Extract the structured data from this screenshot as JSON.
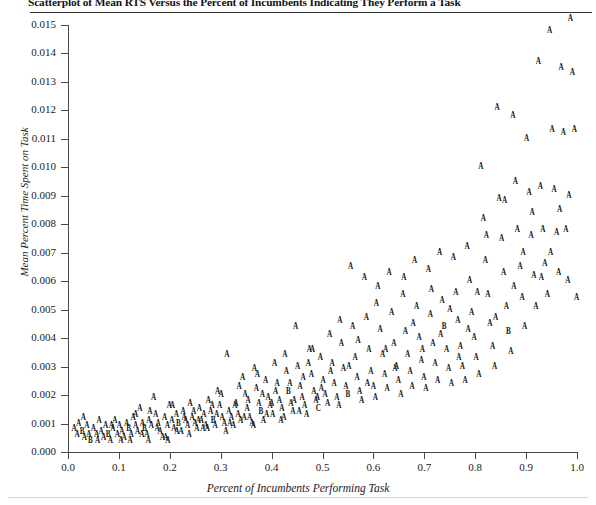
{
  "title": "Scatterplot of Mean RTS Versus the Percent of Incumbents Indicating They Perform a Task",
  "axes": {
    "xlabel": "Percent of Incumbents Performing Task",
    "ylabel": "Mean Percent Time Spent on Task",
    "xticks": [
      "0.0",
      "0.1",
      "0.2",
      "0.3",
      "0.4",
      "0.5",
      "0.6",
      "0.7",
      "0.8",
      "0.9",
      "1.0"
    ],
    "yticks": [
      "0.000",
      "0.001",
      "0.002",
      "0.003",
      "0.004",
      "0.005",
      "0.006",
      "0.007",
      "0.008",
      "0.009",
      "0.010",
      "0.011",
      "0.012",
      "0.013",
      "0.014",
      "0.015"
    ]
  },
  "chart_data": {
    "type": "scatter",
    "title": "Scatterplot of Mean RTS Versus the Percent of Incumbents Indicating They Perform a Task",
    "xlabel": "Percent of Incumbents Performing Task",
    "ylabel": "Mean Percent Time Spent on Task",
    "xlim": [
      0.0,
      1.0
    ],
    "ylim": [
      0.0,
      0.015
    ],
    "xticks": [
      0.0,
      0.1,
      0.2,
      0.3,
      0.4,
      0.5,
      0.6,
      0.7,
      0.8,
      0.9,
      1.0
    ],
    "yticks": [
      0.0,
      0.001,
      0.002,
      0.003,
      0.004,
      0.005,
      0.006,
      0.007,
      0.008,
      0.009,
      0.01,
      0.011,
      0.012,
      0.013,
      0.014,
      0.015
    ],
    "grid": false,
    "legend": null,
    "marker_glyphs": [
      "A",
      "B",
      "C"
    ],
    "marker_note": "Plot symbols are letter glyphs denoting overplotted count: A = 1 observation, B = 2, C = 3",
    "point_count": 296,
    "points": [
      [
        0.012,
        0.0008,
        "A"
      ],
      [
        0.018,
        0.0006,
        "A"
      ],
      [
        0.021,
        0.001,
        "A"
      ],
      [
        0.028,
        0.0007,
        "B"
      ],
      [
        0.032,
        0.0005,
        "A"
      ],
      [
        0.037,
        0.0009,
        "A"
      ],
      [
        0.041,
        0.0006,
        "A"
      ],
      [
        0.044,
        0.0004,
        "B"
      ],
      [
        0.05,
        0.0008,
        "A"
      ],
      [
        0.056,
        0.0006,
        "A"
      ],
      [
        0.061,
        0.0011,
        "A"
      ],
      [
        0.065,
        0.0007,
        "A"
      ],
      [
        0.07,
        0.0005,
        "A"
      ],
      [
        0.074,
        0.0009,
        "A"
      ],
      [
        0.079,
        0.0006,
        "B"
      ],
      [
        0.083,
        0.0004,
        "A"
      ],
      [
        0.088,
        0.0008,
        "A"
      ],
      [
        0.092,
        0.0011,
        "A"
      ],
      [
        0.097,
        0.0006,
        "A"
      ],
      [
        0.101,
        0.0009,
        "A"
      ],
      [
        0.106,
        0.0007,
        "A"
      ],
      [
        0.11,
        0.0005,
        "A"
      ],
      [
        0.115,
        0.001,
        "A"
      ],
      [
        0.119,
        0.0008,
        "B"
      ],
      [
        0.124,
        0.0006,
        "A"
      ],
      [
        0.128,
        0.0012,
        "A"
      ],
      [
        0.133,
        0.0009,
        "A"
      ],
      [
        0.137,
        0.0007,
        "A"
      ],
      [
        0.141,
        0.0015,
        "A"
      ],
      [
        0.146,
        0.001,
        "A"
      ],
      [
        0.15,
        0.0008,
        "B"
      ],
      [
        0.155,
        0.0006,
        "A"
      ],
      [
        0.159,
        0.0011,
        "A"
      ],
      [
        0.164,
        0.0009,
        "A"
      ],
      [
        0.168,
        0.0019,
        "A"
      ],
      [
        0.172,
        0.0013,
        "A"
      ],
      [
        0.177,
        0.001,
        "A"
      ],
      [
        0.181,
        0.0007,
        "A"
      ],
      [
        0.186,
        0.0005,
        "A"
      ],
      [
        0.19,
        0.0012,
        "A"
      ],
      [
        0.195,
        0.0009,
        "A"
      ],
      [
        0.199,
        0.0016,
        "A"
      ],
      [
        0.204,
        0.0011,
        "A"
      ],
      [
        0.208,
        0.0008,
        "A"
      ],
      [
        0.213,
        0.0013,
        "A"
      ],
      [
        0.217,
        0.001,
        "B"
      ],
      [
        0.222,
        0.0007,
        "A"
      ],
      [
        0.226,
        0.0014,
        "A"
      ],
      [
        0.231,
        0.0011,
        "A"
      ],
      [
        0.235,
        0.0009,
        "A"
      ],
      [
        0.24,
        0.0017,
        "A"
      ],
      [
        0.244,
        0.0012,
        "A"
      ],
      [
        0.249,
        0.001,
        "A"
      ],
      [
        0.253,
        0.0008,
        "A"
      ],
      [
        0.258,
        0.0015,
        "A"
      ],
      [
        0.262,
        0.0011,
        "A"
      ],
      [
        0.267,
        0.0013,
        "A"
      ],
      [
        0.271,
        0.0009,
        "A"
      ],
      [
        0.276,
        0.0018,
        "A"
      ],
      [
        0.28,
        0.0014,
        "A"
      ],
      [
        0.285,
        0.0011,
        "B"
      ],
      [
        0.289,
        0.0009,
        "A"
      ],
      [
        0.294,
        0.0021,
        "A"
      ],
      [
        0.298,
        0.0016,
        "A"
      ],
      [
        0.303,
        0.0012,
        "A"
      ],
      [
        0.307,
        0.001,
        "A"
      ],
      [
        0.312,
        0.0034,
        "A"
      ],
      [
        0.316,
        0.0014,
        "A"
      ],
      [
        0.321,
        0.0012,
        "A"
      ],
      [
        0.325,
        0.0009,
        "A"
      ],
      [
        0.33,
        0.0017,
        "A"
      ],
      [
        0.334,
        0.0013,
        "A"
      ],
      [
        0.339,
        0.0011,
        "A"
      ],
      [
        0.343,
        0.0026,
        "A"
      ],
      [
        0.348,
        0.002,
        "A"
      ],
      [
        0.352,
        0.0015,
        "A"
      ],
      [
        0.357,
        0.0012,
        "A"
      ],
      [
        0.361,
        0.001,
        "A"
      ],
      [
        0.366,
        0.0029,
        "A"
      ],
      [
        0.37,
        0.0022,
        "A"
      ],
      [
        0.375,
        0.0017,
        "A"
      ],
      [
        0.379,
        0.0014,
        "B"
      ],
      [
        0.384,
        0.0011,
        "A"
      ],
      [
        0.388,
        0.0025,
        "A"
      ],
      [
        0.393,
        0.0019,
        "A"
      ],
      [
        0.397,
        0.0016,
        "A"
      ],
      [
        0.402,
        0.0013,
        "A"
      ],
      [
        0.406,
        0.0031,
        "A"
      ],
      [
        0.411,
        0.0024,
        "A"
      ],
      [
        0.415,
        0.0018,
        "A"
      ],
      [
        0.42,
        0.0015,
        "A"
      ],
      [
        0.424,
        0.0012,
        "A"
      ],
      [
        0.429,
        0.0028,
        "A"
      ],
      [
        0.433,
        0.0021,
        "B"
      ],
      [
        0.438,
        0.0017,
        "A"
      ],
      [
        0.442,
        0.0014,
        "A"
      ],
      [
        0.447,
        0.0044,
        "A"
      ],
      [
        0.451,
        0.003,
        "A"
      ],
      [
        0.456,
        0.0023,
        "A"
      ],
      [
        0.46,
        0.0019,
        "A"
      ],
      [
        0.465,
        0.0016,
        "A"
      ],
      [
        0.469,
        0.0013,
        "A"
      ],
      [
        0.474,
        0.0036,
        "A"
      ],
      [
        0.478,
        0.0027,
        "A"
      ],
      [
        0.483,
        0.0021,
        "A"
      ],
      [
        0.487,
        0.0018,
        "A"
      ],
      [
        0.492,
        0.0015,
        "C"
      ],
      [
        0.496,
        0.0033,
        "A"
      ],
      [
        0.501,
        0.0025,
        "A"
      ],
      [
        0.505,
        0.002,
        "A"
      ],
      [
        0.51,
        0.0017,
        "A"
      ],
      [
        0.514,
        0.0041,
        "A"
      ],
      [
        0.519,
        0.0031,
        "A"
      ],
      [
        0.523,
        0.0024,
        "A"
      ],
      [
        0.528,
        0.0019,
        "A"
      ],
      [
        0.532,
        0.0016,
        "A"
      ],
      [
        0.537,
        0.0038,
        "A"
      ],
      [
        0.541,
        0.0029,
        "A"
      ],
      [
        0.546,
        0.0023,
        "A"
      ],
      [
        0.55,
        0.002,
        "B"
      ],
      [
        0.555,
        0.0065,
        "A"
      ],
      [
        0.559,
        0.0044,
        "A"
      ],
      [
        0.564,
        0.0033,
        "A"
      ],
      [
        0.568,
        0.0026,
        "A"
      ],
      [
        0.573,
        0.0021,
        "A"
      ],
      [
        0.577,
        0.0018,
        "A"
      ],
      [
        0.582,
        0.0061,
        "A"
      ],
      [
        0.586,
        0.0047,
        "A"
      ],
      [
        0.591,
        0.0036,
        "A"
      ],
      [
        0.595,
        0.0028,
        "A"
      ],
      [
        0.6,
        0.0023,
        "A"
      ],
      [
        0.604,
        0.0019,
        "A"
      ],
      [
        0.609,
        0.0058,
        "A"
      ],
      [
        0.613,
        0.0043,
        "A"
      ],
      [
        0.618,
        0.0034,
        "A"
      ],
      [
        0.622,
        0.0027,
        "A"
      ],
      [
        0.627,
        0.0022,
        "A"
      ],
      [
        0.631,
        0.0063,
        "A"
      ],
      [
        0.636,
        0.0049,
        "A"
      ],
      [
        0.64,
        0.0038,
        "A"
      ],
      [
        0.645,
        0.003,
        "A"
      ],
      [
        0.649,
        0.0025,
        "A"
      ],
      [
        0.654,
        0.002,
        "A"
      ],
      [
        0.658,
        0.0055,
        "A"
      ],
      [
        0.663,
        0.0042,
        "A"
      ],
      [
        0.667,
        0.0034,
        "A"
      ],
      [
        0.672,
        0.0028,
        "A"
      ],
      [
        0.676,
        0.0023,
        "A"
      ],
      [
        0.681,
        0.0067,
        "A"
      ],
      [
        0.685,
        0.0051,
        "A"
      ],
      [
        0.69,
        0.004,
        "A"
      ],
      [
        0.694,
        0.0032,
        "A"
      ],
      [
        0.699,
        0.0026,
        "A"
      ],
      [
        0.703,
        0.0022,
        "A"
      ],
      [
        0.708,
        0.0064,
        "A"
      ],
      [
        0.712,
        0.0048,
        "A"
      ],
      [
        0.717,
        0.0038,
        "A"
      ],
      [
        0.721,
        0.0031,
        "A"
      ],
      [
        0.726,
        0.0025,
        "A"
      ],
      [
        0.73,
        0.007,
        "A"
      ],
      [
        0.735,
        0.0053,
        "A"
      ],
      [
        0.739,
        0.0044,
        "B"
      ],
      [
        0.744,
        0.0036,
        "A"
      ],
      [
        0.748,
        0.0029,
        "A"
      ],
      [
        0.753,
        0.0024,
        "A"
      ],
      [
        0.757,
        0.0068,
        "A"
      ],
      [
        0.762,
        0.0056,
        "A"
      ],
      [
        0.766,
        0.0046,
        "A"
      ],
      [
        0.771,
        0.0037,
        "A"
      ],
      [
        0.775,
        0.003,
        "A"
      ],
      [
        0.78,
        0.0025,
        "A"
      ],
      [
        0.784,
        0.0072,
        "A"
      ],
      [
        0.789,
        0.006,
        "A"
      ],
      [
        0.793,
        0.0049,
        "A"
      ],
      [
        0.798,
        0.004,
        "A"
      ],
      [
        0.802,
        0.0033,
        "A"
      ],
      [
        0.807,
        0.0027,
        "A"
      ],
      [
        0.811,
        0.01,
        "A"
      ],
      [
        0.816,
        0.0082,
        "A"
      ],
      [
        0.82,
        0.0067,
        "A"
      ],
      [
        0.825,
        0.0055,
        "A"
      ],
      [
        0.829,
        0.0045,
        "A"
      ],
      [
        0.834,
        0.0037,
        "A"
      ],
      [
        0.838,
        0.003,
        "A"
      ],
      [
        0.843,
        0.0121,
        "A"
      ],
      [
        0.847,
        0.0089,
        "A"
      ],
      [
        0.852,
        0.0075,
        "A"
      ],
      [
        0.856,
        0.0063,
        "A"
      ],
      [
        0.861,
        0.0051,
        "A"
      ],
      [
        0.865,
        0.0042,
        "B"
      ],
      [
        0.87,
        0.0035,
        "A"
      ],
      [
        0.874,
        0.0118,
        "A"
      ],
      [
        0.879,
        0.0095,
        "A"
      ],
      [
        0.883,
        0.0078,
        "A"
      ],
      [
        0.888,
        0.0065,
        "A"
      ],
      [
        0.892,
        0.0054,
        "A"
      ],
      [
        0.897,
        0.0044,
        "A"
      ],
      [
        0.901,
        0.011,
        "A"
      ],
      [
        0.906,
        0.0091,
        "A"
      ],
      [
        0.91,
        0.0076,
        "A"
      ],
      [
        0.915,
        0.0062,
        "A"
      ],
      [
        0.919,
        0.0051,
        "A"
      ],
      [
        0.924,
        0.0137,
        "A"
      ],
      [
        0.928,
        0.0093,
        "A"
      ],
      [
        0.933,
        0.0078,
        "A"
      ],
      [
        0.937,
        0.0066,
        "A"
      ],
      [
        0.942,
        0.0055,
        "A"
      ],
      [
        0.946,
        0.0148,
        "A"
      ],
      [
        0.951,
        0.0113,
        "A"
      ],
      [
        0.955,
        0.0092,
        "A"
      ],
      [
        0.96,
        0.0077,
        "A"
      ],
      [
        0.964,
        0.0063,
        "A"
      ],
      [
        0.969,
        0.0135,
        "A"
      ],
      [
        0.973,
        0.0112,
        "A"
      ],
      [
        0.978,
        0.0078,
        "A"
      ],
      [
        0.982,
        0.006,
        "A"
      ],
      [
        0.987,
        0.0152,
        "A"
      ],
      [
        0.991,
        0.0133,
        "A"
      ],
      [
        0.995,
        0.0113,
        "A"
      ],
      [
        0.999,
        0.0054,
        "A"
      ],
      [
        0.085,
        0.0009,
        "A"
      ],
      [
        0.133,
        0.0013,
        "A"
      ],
      [
        0.145,
        0.0006,
        "A"
      ],
      [
        0.161,
        0.0014,
        "A"
      ],
      [
        0.175,
        0.0008,
        "A"
      ],
      [
        0.192,
        0.0005,
        "A"
      ],
      [
        0.205,
        0.0016,
        "A"
      ],
      [
        0.228,
        0.0012,
        "A"
      ],
      [
        0.247,
        0.0014,
        "A"
      ],
      [
        0.265,
        0.0008,
        "A"
      ],
      [
        0.283,
        0.0016,
        "A"
      ],
      [
        0.301,
        0.002,
        "A"
      ],
      [
        0.318,
        0.001,
        "A"
      ],
      [
        0.336,
        0.0023,
        "A"
      ],
      [
        0.354,
        0.0018,
        "A"
      ],
      [
        0.372,
        0.0027,
        "A"
      ],
      [
        0.39,
        0.0013,
        "A"
      ],
      [
        0.408,
        0.0021,
        "A"
      ],
      [
        0.426,
        0.0034,
        "A"
      ],
      [
        0.444,
        0.0018,
        "A"
      ],
      [
        0.462,
        0.0026,
        "A"
      ],
      [
        0.48,
        0.0036,
        "A"
      ],
      [
        0.498,
        0.0022,
        "A"
      ],
      [
        0.516,
        0.0028,
        "A"
      ],
      [
        0.534,
        0.0046,
        "A"
      ],
      [
        0.552,
        0.003,
        "A"
      ],
      [
        0.57,
        0.0039,
        "A"
      ],
      [
        0.588,
        0.0024,
        "A"
      ],
      [
        0.606,
        0.0052,
        "A"
      ],
      [
        0.624,
        0.0036,
        "A"
      ],
      [
        0.642,
        0.0029,
        "A"
      ],
      [
        0.66,
        0.0061,
        "A"
      ],
      [
        0.678,
        0.0045,
        "A"
      ],
      [
        0.696,
        0.0036,
        "A"
      ],
      [
        0.714,
        0.0057,
        "A"
      ],
      [
        0.732,
        0.0041,
        "A"
      ],
      [
        0.75,
        0.005,
        "A"
      ],
      [
        0.768,
        0.0033,
        "A"
      ],
      [
        0.786,
        0.0043,
        "A"
      ],
      [
        0.804,
        0.0056,
        "A"
      ],
      [
        0.822,
        0.0076,
        "A"
      ],
      [
        0.84,
        0.0047,
        "A"
      ],
      [
        0.858,
        0.0088,
        "A"
      ],
      [
        0.876,
        0.0058,
        "A"
      ],
      [
        0.894,
        0.007,
        "A"
      ],
      [
        0.912,
        0.0084,
        "A"
      ],
      [
        0.93,
        0.0061,
        "A"
      ],
      [
        0.948,
        0.007,
        "A"
      ],
      [
        0.966,
        0.0085,
        "A"
      ],
      [
        0.984,
        0.009,
        "A"
      ],
      [
        0.03,
        0.0012,
        "A"
      ],
      [
        0.058,
        0.0004,
        "A"
      ],
      [
        0.104,
        0.0004,
        "A"
      ],
      [
        0.122,
        0.0004,
        "A"
      ],
      [
        0.158,
        0.0004,
        "A"
      ],
      [
        0.196,
        0.0004,
        "A"
      ],
      [
        0.214,
        0.0007,
        "A"
      ],
      [
        0.238,
        0.0006,
        "A"
      ],
      [
        0.256,
        0.0011,
        "A"
      ],
      [
        0.274,
        0.0008,
        "A"
      ],
      [
        0.292,
        0.0013,
        "A"
      ],
      [
        0.31,
        0.0007,
        "A"
      ],
      [
        0.328,
        0.0016,
        "A"
      ],
      [
        0.346,
        0.0012,
        "A"
      ],
      [
        0.364,
        0.0009,
        "A"
      ],
      [
        0.382,
        0.002,
        "A"
      ],
      [
        0.4,
        0.0017,
        "A"
      ],
      [
        0.418,
        0.0011,
        "A"
      ],
      [
        0.436,
        0.0024,
        "A"
      ],
      [
        0.454,
        0.0014,
        "A"
      ],
      [
        0.472,
        0.0031,
        "A"
      ],
      [
        0.49,
        0.0019,
        "A"
      ]
    ]
  }
}
